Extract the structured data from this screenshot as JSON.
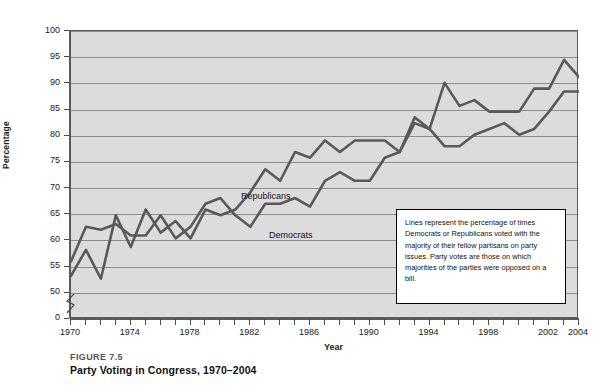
{
  "figure": {
    "number": "FIGURE 7.5",
    "title": "Party Voting in Congress, 1970–2004"
  },
  "annotation": {
    "text": "Lines represent the percentage of times Democrats or Republicans voted with the majority of their fellow partisans on party issues. Party votes are those on which majorities of the parties were opposed on a bill."
  },
  "colors": {
    "plot_background": "#dcdcdc",
    "gridline": "#8c8c8c",
    "axis": "#5a5a5a",
    "series_line": "#595959",
    "annotation_border": "#000000",
    "text": "#111111"
  },
  "chart_data": {
    "type": "line",
    "title": "Party Voting in Congress, 1970–2004",
    "xlabel": "Year",
    "ylabel": "Percentage",
    "xlim": [
      1970,
      2004
    ],
    "ylim": [
      45,
      100
    ],
    "ytick_labels": [
      "0",
      "50",
      "55",
      "60",
      "65",
      "70",
      "75",
      "80",
      "85",
      "90",
      "95",
      "100"
    ],
    "yticks": [
      0,
      50,
      55,
      60,
      65,
      70,
      75,
      80,
      85,
      90,
      95,
      100
    ],
    "axis_break": true,
    "grid": true,
    "legend_position": "inline-labels",
    "x": [
      1970,
      1971,
      1972,
      1973,
      1974,
      1975,
      1976,
      1977,
      1978,
      1979,
      1980,
      1981,
      1982,
      1983,
      1984,
      1985,
      1986,
      1987,
      1988,
      1989,
      1990,
      1991,
      1992,
      1993,
      1994,
      1995,
      1996,
      1997,
      1998,
      1999,
      2000,
      2001,
      2002,
      2003,
      2004
    ],
    "series": [
      {
        "name": "Republicans",
        "values": [
          60,
          66,
          65.5,
          66.5,
          64.5,
          64.5,
          68,
          64,
          66,
          70,
          71,
          68,
          66,
          70,
          70,
          71,
          69.5,
          74,
          75.5,
          74,
          74,
          78,
          79,
          84,
          83,
          91,
          87,
          88,
          86,
          86,
          86,
          90,
          90,
          95,
          92
        ]
      },
      {
        "name": "Democrats",
        "values": [
          57.5,
          62,
          57,
          68,
          62.5,
          69,
          65,
          67,
          64,
          69,
          68,
          69,
          72,
          76,
          74,
          79,
          78,
          81,
          79,
          81,
          81,
          81,
          79,
          85,
          83,
          80,
          80,
          82,
          83,
          84,
          82,
          83,
          86,
          89.5,
          89.5
        ]
      }
    ]
  },
  "axes": {
    "x_tick_years": [
      1970,
      1974,
      1978,
      1982,
      1986,
      1990,
      1994,
      1998,
      2002,
      2004
    ]
  }
}
